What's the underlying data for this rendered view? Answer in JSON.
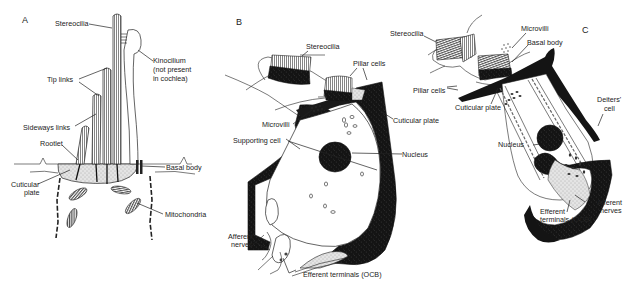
{
  "figure": {
    "panels": [
      {
        "id": "A",
        "label": "A",
        "annotations": {
          "stereocilia": "Stereocilia",
          "kinocilium_1": "Kinocilium",
          "kinocilium_2": "(not present",
          "kinocilium_3": "in cochlea)",
          "tip_links": "Tip links",
          "sideways_links": "Sideways links",
          "rootlet": "Rootlet",
          "basal_body": "Basal body",
          "cuticular_plate_1": "Cuticular",
          "cuticular_plate_2": "plate",
          "mitochondria": "Mitochondria"
        }
      },
      {
        "id": "B",
        "label": "B",
        "annotations": {
          "stereocilia": "Stereocilia",
          "pillar_cells": "Pillar cells",
          "microvilli": "Microvilli",
          "cuticular_plate": "Cuticular plate",
          "supporting_cell": "Supporting cell",
          "nucleus": "Nucleus",
          "afferent_nerves_1": "Afferent",
          "afferent_nerves_2": "nerves",
          "efferent_terminals": "Efferent terminals (OCB)"
        }
      },
      {
        "id": "C",
        "label": "C",
        "annotations": {
          "stereocilia": "Stereocilia",
          "microvilli": "Microvilli",
          "basal_body": "Basal body",
          "pillar_cells": "Pillar cells",
          "cuticular_plate": "Cuticular plate",
          "deiters_cell_1": "Deiters'",
          "deiters_cell_2": "cell",
          "nucleus": "Nucleus",
          "efferent_terminals_1": "Efferent",
          "efferent_terminals_2": "terminals (OCB)",
          "afferent_nerves_1": "Afferent",
          "afferent_nerves_2": "nerves"
        }
      }
    ]
  }
}
